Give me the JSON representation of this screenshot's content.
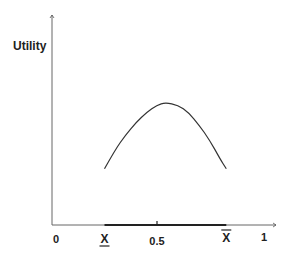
{
  "chart_data": {
    "type": "line",
    "title": "",
    "xlabel": "",
    "ylabel": "Utility",
    "xlim": [
      0,
      1
    ],
    "x_ticks": [
      {
        "value": 0,
        "label": "0"
      },
      {
        "value": 0.25,
        "label": "X",
        "decoration": "underline"
      },
      {
        "value": 0.5,
        "label": "0.5"
      },
      {
        "value": 0.83,
        "label": "X",
        "decoration": "overline"
      },
      {
        "value": 1,
        "label": "1"
      }
    ],
    "highlighted_interval": {
      "from": 0.25,
      "to": 0.83
    },
    "series": [
      {
        "name": "utility-curve",
        "shape": "inverted-parabola",
        "x": [
          0.25,
          0.3,
          0.35,
          0.4,
          0.45,
          0.5,
          0.54,
          0.6,
          0.65,
          0.7,
          0.75,
          0.8,
          0.83
        ],
        "y": [
          0.45,
          0.6,
          0.72,
          0.82,
          0.9,
          0.96,
          0.98,
          0.96,
          0.9,
          0.8,
          0.68,
          0.53,
          0.45
        ]
      }
    ],
    "ylim": [
      0,
      1
    ],
    "grid": false,
    "legend": "none",
    "colors": {
      "axis": "#555555",
      "curve": "#333333",
      "interval": "#222222",
      "text": "#222222"
    }
  }
}
